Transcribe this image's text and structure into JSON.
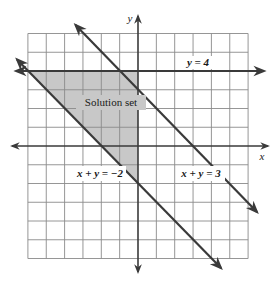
{
  "figure": {
    "axes": {
      "x_label": "x",
      "y_label": "y",
      "x_range": [
        -6,
        6
      ],
      "y_range": [
        -6,
        6
      ],
      "grid": true,
      "grid_step": 1
    },
    "lines": [
      {
        "equation": "y = 4",
        "label": "y = 4"
      },
      {
        "equation": "x + y = 3",
        "label": "x + y = 3"
      },
      {
        "equation": "x + y = -2",
        "label": "x + y = −2"
      }
    ],
    "region": {
      "label": "Solution set",
      "vertices": [
        [
          -6,
          4
        ],
        [
          0,
          4
        ],
        [
          0,
          -2
        ]
      ],
      "fill_color": "#c8c8c8"
    },
    "colors": {
      "grid": "#8a8a8a",
      "axes": "#3a3a3a",
      "lines": "#3a3a3a",
      "shade": "#c8c8c8",
      "background": "#ffffff"
    }
  }
}
